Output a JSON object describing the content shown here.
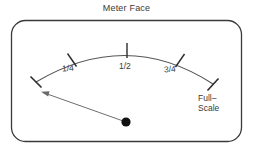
{
  "figure": {
    "title": "Meter Face",
    "type": "analog-meter-face-diagram",
    "width": 253,
    "height": 148,
    "background_color": "#ffffff",
    "line_color": "#3a3a3a",
    "text_color": "#3a3a3a"
  },
  "panel": {
    "name": "rounded-rectangle-border",
    "x": 11,
    "y": 20,
    "width": 231,
    "height": 122,
    "corner_radius": 14,
    "stroke_color": "#3a3a3a",
    "stroke_width": 1.2,
    "fill": "none"
  },
  "scale_arc": {
    "name": "meter-scale-arc",
    "start_point": [
      36,
      82
    ],
    "apex_point": [
      127,
      48
    ],
    "end_point": [
      213,
      84
    ],
    "stroke_color": "#555555",
    "stroke_width": 1.1
  },
  "ticks": [
    {
      "name": "tick-zero",
      "label": "",
      "x": 36,
      "y": 82,
      "angle_deg": -58
    },
    {
      "name": "tick-one-quarter",
      "label": "1/4",
      "x": 72,
      "y": 58,
      "angle_deg": -28
    },
    {
      "name": "tick-one-half",
      "label": "1/2",
      "x": 127,
      "y": 48,
      "angle_deg": 0
    },
    {
      "name": "tick-three-quarter",
      "label": "3/4",
      "x": 180,
      "y": 59,
      "angle_deg": 27
    },
    {
      "name": "tick-full-scale",
      "label": "",
      "x": 213,
      "y": 84,
      "angle_deg": 55
    }
  ],
  "labels": {
    "quarter": "1/4",
    "half": "1/2",
    "three_quarter": "3/4",
    "full_scale_line1": "Full–",
    "full_scale_line2": "Scale"
  },
  "needle": {
    "name": "meter-needle",
    "pivot": [
      126,
      122
    ],
    "tip": [
      42,
      92
    ],
    "has_arrowhead": true,
    "arrowhead_at": "tip",
    "stroke_color": "#555555",
    "stroke_width": 0.9,
    "reading": "below-zero"
  },
  "pivot_dot": {
    "name": "needle-pivot-dot",
    "cx": 126,
    "cy": 122,
    "r": 4.6,
    "fill": "#111111"
  }
}
